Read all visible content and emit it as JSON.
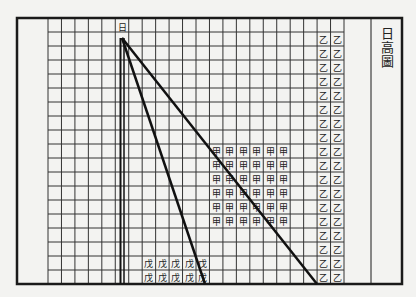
{
  "title_chars": [
    "日",
    "高",
    "圖"
  ],
  "sun_label": "日",
  "markers": {
    "jia": "甲",
    "yi": "乙",
    "wu": "戊"
  },
  "grid": {
    "left": 48,
    "top": 18,
    "right": 344,
    "bottom": 284,
    "cols": 22,
    "rows": 19
  },
  "frame": {
    "outer_left": 17,
    "outer_top": 18,
    "outer_right": 402,
    "outer_bottom": 284,
    "title_separator_x": 371
  },
  "regions": {
    "jia_block": {
      "col_start": 12,
      "row_start": 9,
      "cols": 6,
      "rows": 6
    },
    "yi_column": {
      "col_start": 20,
      "row_start": 1,
      "cols": 2,
      "rows": 18
    },
    "wu_block": {
      "col_start": 7,
      "row_start": 17,
      "cols": 5,
      "rows": 2
    }
  },
  "lines": {
    "apex": [
      122,
      38
    ],
    "vertical_end": [
      122,
      284
    ],
    "steep_end": [
      205,
      284
    ],
    "shallow_end": [
      317,
      284
    ]
  },
  "colors": {
    "ink": "#1a1a1a",
    "paper": "#f3f3f1"
  }
}
